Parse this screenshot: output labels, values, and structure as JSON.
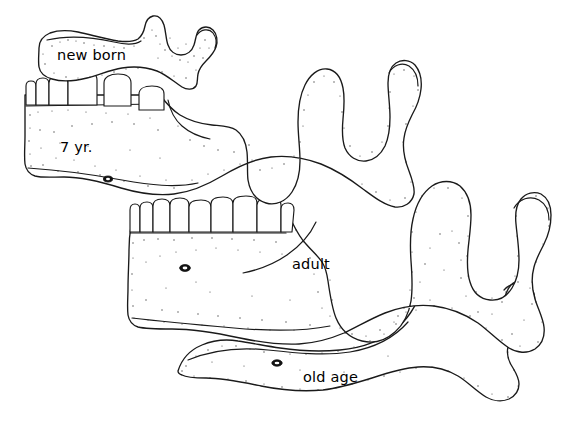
{
  "figure": {
    "background_color": "#ffffff",
    "ink_color": "#1a1a1a",
    "width": 563,
    "height": 426
  },
  "labels": {
    "new_born": "new born",
    "seven_year": "7 yr.",
    "adult": "adult",
    "old_age": "old age"
  },
  "specimens": [
    {
      "id": "new-born",
      "label": "new born",
      "teeth_visible": 0,
      "description": "shallow elongated body, low ramus, small coronoid peak, obtuse angle"
    },
    {
      "id": "seven-year",
      "label": "7 yr.",
      "teeth_visible": 6,
      "description": "deep body with mixed dentition, developing ramus, mental foramen low on body"
    },
    {
      "id": "adult",
      "label": "adult",
      "teeth_visible": 8,
      "description": "full permanent dentition, tall vertical ramus, deep sigmoid notch, near right-angled gonial angle"
    },
    {
      "id": "old-age",
      "label": "old age",
      "teeth_visible": 0,
      "description": "edentulous resorbed alveolar border, thin body, oblique ramus, obtuse gonial angle, foramen near upper border"
    }
  ],
  "anatomy_parts": {
    "condyle": "condyle",
    "coronoid_process": "coronoid process",
    "sigmoid_notch": "sigmoid notch",
    "ramus": "ramus",
    "body": "body",
    "gonial_angle": "angle of mandible",
    "mental_foramen": "mental foramen",
    "alveolar_border": "alveolar border"
  }
}
